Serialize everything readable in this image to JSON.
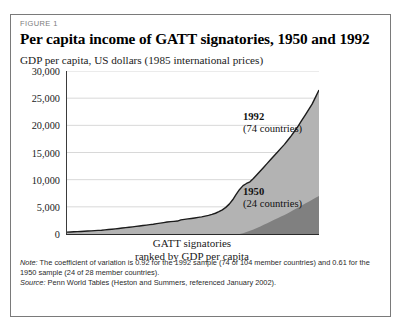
{
  "figure": {
    "label": "FIGURE 1",
    "title": "Per capita income of GATT signatories, 1950 and 1992",
    "axis_caption": "GDP per capita, US dollars (1985 international prices)",
    "x_caption_line1": "GATT signatories",
    "x_caption_line2": "ranked by GDP per capita"
  },
  "annotations": {
    "series_1992_label": "1992",
    "series_1992_sub": "(74 countries)",
    "series_1950_label": "1950",
    "series_1950_sub": "(24 countries)"
  },
  "notes": {
    "note_prefix": "Note:",
    "note_text": " The coefficient of variation is 0.92 for the 1992 sample (74 of 104 member countries) and 0.61 for the 1950 sample (24 of 28 member countries).",
    "source_prefix": "Source:",
    "source_text": " Penn World Tables (Heston and Summers, referenced January 2002)."
  },
  "colors": {
    "series_1992_fill": "#b3b3b3",
    "series_1950_fill": "#808080",
    "curve_line": "#1c1c1c",
    "gridline": "#d8d8d8",
    "axis": "#2b2b2b",
    "border": "#7a7a7a"
  },
  "chart_data": {
    "type": "area",
    "title": "Per capita income of GATT signatories, 1950 and 1992",
    "xlabel": "GATT signatories ranked by GDP per capita",
    "ylabel": "GDP per capita, US dollars (1985 international prices)",
    "ylim": [
      0,
      30000
    ],
    "yticks": [
      "0",
      "5,000",
      "10,000",
      "15,000",
      "20,000",
      "25,000",
      "30,000"
    ],
    "ytick_values": [
      0,
      5000,
      10000,
      15000,
      20000,
      25000,
      30000
    ],
    "grid": true,
    "legend": "annotations-on-plot",
    "series": [
      {
        "name": "1992",
        "countries": 74,
        "coefficient_of_variation": 0.92,
        "x": [
          0,
          1,
          2,
          3,
          4,
          5,
          6,
          7,
          8,
          9,
          10,
          11,
          12,
          13,
          14,
          15,
          16,
          17,
          18,
          19,
          20,
          21,
          22,
          23,
          24,
          25,
          26,
          27,
          28,
          29,
          30,
          31,
          32,
          33,
          34,
          35,
          36,
          37,
          38,
          39,
          40,
          41,
          42,
          43,
          44,
          45,
          46,
          47,
          48,
          49,
          50,
          51,
          52,
          53,
          54,
          55,
          56,
          57,
          58,
          59,
          60,
          61,
          62,
          63,
          64,
          65,
          66,
          67,
          68,
          69,
          70,
          71,
          72,
          73
        ],
        "values": [
          350,
          380,
          410,
          440,
          470,
          500,
          540,
          580,
          620,
          660,
          700,
          760,
          820,
          880,
          950,
          1020,
          1100,
          1180,
          1250,
          1320,
          1400,
          1480,
          1560,
          1640,
          1720,
          1800,
          1900,
          2000,
          2100,
          2200,
          2280,
          2330,
          2380,
          2600,
          2700,
          2780,
          2860,
          2950,
          3050,
          3150,
          3280,
          3420,
          3600,
          3820,
          4100,
          4450,
          4900,
          5500,
          6300,
          7300,
          8200,
          8900,
          9300,
          9600,
          10200,
          10900,
          11600,
          12300,
          13000,
          13700,
          14400,
          15100,
          15800,
          16500,
          17300,
          18100,
          19000,
          19900,
          20900,
          21900,
          22900,
          23900,
          25200,
          26500
        ]
      },
      {
        "name": "1950",
        "countries": 24,
        "coefficient_of_variation": 0.61,
        "x": [
          50,
          51,
          52,
          53,
          54,
          55,
          56,
          57,
          58,
          59,
          60,
          61,
          62,
          63,
          64,
          65,
          66,
          67,
          68,
          69,
          70,
          71,
          72,
          73
        ],
        "values": [
          0,
          150,
          350,
          600,
          850,
          1100,
          1400,
          1700,
          2000,
          2300,
          2600,
          2900,
          3200,
          3500,
          3800,
          4200,
          4550,
          4900,
          5250,
          5600,
          5950,
          6300,
          6650,
          7000
        ]
      }
    ]
  }
}
